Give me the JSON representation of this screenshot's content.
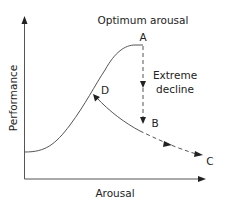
{
  "diagram": {
    "title": "Optimum arousal",
    "axes": {
      "x_label": "Arousal",
      "y_label": "Performance"
    },
    "points": {
      "A": "A",
      "B": "B",
      "C": "C",
      "D": "D"
    },
    "annotation": {
      "line1": "Extreme",
      "line2": "decline"
    },
    "colors": {
      "line": "#555555",
      "text": "#222222",
      "background": "#ffffff"
    }
  }
}
